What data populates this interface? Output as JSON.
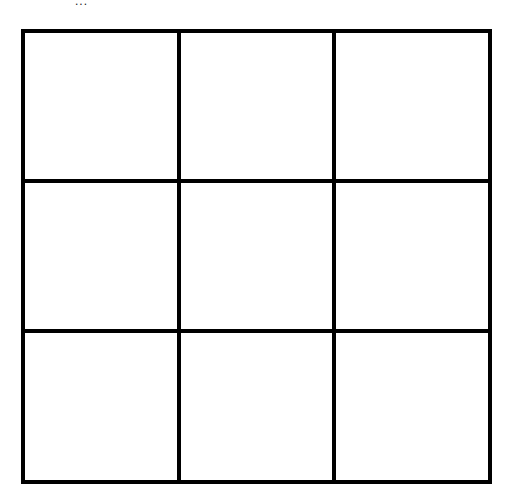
{
  "top_mark": "...",
  "board": {
    "rows": 3,
    "cols": 3,
    "line_color": "#000000",
    "background": "#ffffff",
    "cells": [
      {
        "row": 0,
        "col": 0,
        "value": ""
      },
      {
        "row": 0,
        "col": 1,
        "value": ""
      },
      {
        "row": 0,
        "col": 2,
        "value": ""
      },
      {
        "row": 1,
        "col": 0,
        "value": ""
      },
      {
        "row": 1,
        "col": 1,
        "value": ""
      },
      {
        "row": 1,
        "col": 2,
        "value": ""
      },
      {
        "row": 2,
        "col": 0,
        "value": ""
      },
      {
        "row": 2,
        "col": 1,
        "value": ""
      },
      {
        "row": 2,
        "col": 2,
        "value": ""
      }
    ]
  }
}
